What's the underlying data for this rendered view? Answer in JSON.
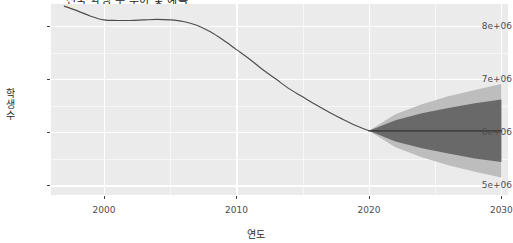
{
  "chart_data": {
    "type": "line",
    "title": "전국 학생 수 추이 및 예측",
    "xlabel": "연도",
    "ylabel": "학생수",
    "xlim": [
      1996,
      2030.5
    ],
    "ylim": [
      4820000,
      8420000
    ],
    "xticks": [
      2000,
      2010,
      2020,
      2030
    ],
    "xtick_labels": [
      "2000",
      "2010",
      "2020",
      "2030"
    ],
    "yticks": [
      5000000,
      6000000,
      7000000,
      8000000
    ],
    "ytick_labels": [
      "5e+06",
      "6e+06",
      "7e+06",
      "8e+06"
    ],
    "x_minor_ticks": [
      1995,
      2005,
      2015,
      2025
    ],
    "y_minor_ticks": [
      5500000,
      6500000,
      7500000,
      8500000
    ],
    "grid": true,
    "legend": "none",
    "panel_background": "#ebebeb",
    "grid_color": "#ffffff",
    "line_color": "#4d4d4d",
    "forecast_line_color": "#333333",
    "band_80_color": "#696969",
    "band_95_color": "#bdbdbd",
    "series": [
      {
        "name": "관측치",
        "type": "observed",
        "x": [
          1997,
          1998,
          1999,
          2000,
          2001,
          2002,
          2003,
          2004,
          2005,
          2006,
          2007,
          2008,
          2009,
          2010,
          2011,
          2012,
          2013,
          2014,
          2015,
          2016,
          2017,
          2018,
          2019,
          2020
        ],
        "values": [
          8380000,
          8290000,
          8190000,
          8120000,
          8110000,
          8110000,
          8120000,
          8130000,
          8120000,
          8090000,
          8020000,
          7900000,
          7740000,
          7560000,
          7380000,
          7180000,
          7000000,
          6820000,
          6670000,
          6520000,
          6380000,
          6250000,
          6130000,
          6030000
        ]
      },
      {
        "name": "예측치",
        "type": "forecast",
        "x": [
          2020,
          2022,
          2024,
          2026,
          2028,
          2030
        ],
        "values": [
          6030000,
          6030000,
          6030000,
          6030000,
          6030000,
          6030000
        ],
        "lo_80": [
          6030000,
          5830000,
          5700000,
          5600000,
          5510000,
          5440000
        ],
        "hi_80": [
          6030000,
          6230000,
          6360000,
          6460000,
          6550000,
          6620000
        ],
        "lo_95": [
          6030000,
          5720000,
          5530000,
          5380000,
          5260000,
          5150000
        ],
        "hi_95": [
          6030000,
          6340000,
          6530000,
          6680000,
          6800000,
          6910000
        ]
      }
    ]
  }
}
